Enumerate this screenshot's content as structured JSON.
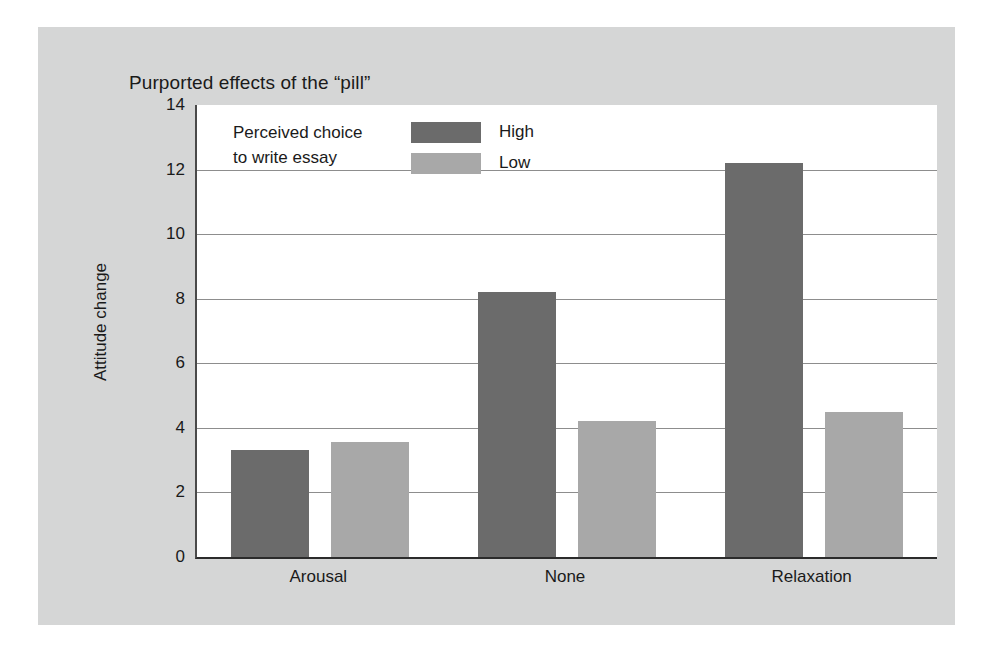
{
  "chart_data": {
    "type": "bar",
    "title": "Purported effects of the “pill”",
    "xlabel": "",
    "ylabel": "Attitude change",
    "categories": [
      "Arousal",
      "None",
      "Relaxation"
    ],
    "series": [
      {
        "name": "High",
        "color": "#6b6b6b",
        "values": [
          3.3,
          8.2,
          12.2
        ]
      },
      {
        "name": "Low",
        "color": "#a8a8a8",
        "values": [
          3.55,
          4.2,
          4.5
        ]
      }
    ],
    "ylim": [
      0,
      14
    ],
    "yticks": [
      0,
      2,
      4,
      6,
      8,
      10,
      12,
      14
    ],
    "ytick_labels": [
      "0",
      "2",
      "4",
      "6",
      "8",
      "10",
      "12",
      "14"
    ],
    "grid": true,
    "legend_position": "inside-top-left",
    "legend_title": "Perceived choice to write essay",
    "legend_title_line1": "Perceived choice",
    "legend_title_line2": "to write essay"
  },
  "figure": {
    "panel_background": "#d5d6d6",
    "plot_background": "#ffffff",
    "axis_color": "#2b2b2b",
    "grid_color": "#8d8d8d",
    "text_color": "#1a1a1a"
  }
}
